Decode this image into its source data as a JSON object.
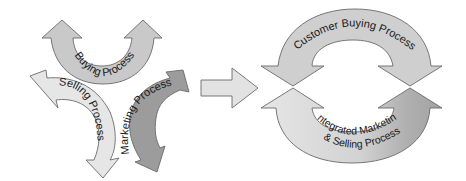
{
  "left_cycle": {
    "buying": {
      "label": "Buying Process",
      "fill": "#c9c9c9"
    },
    "selling": {
      "label": "Selling Process",
      "fill": "#e6e6e6"
    },
    "marketing": {
      "label": "Marketing Process",
      "fill": "#9c9c9c"
    }
  },
  "transition_arrow": {
    "fill": "#e2e2e2"
  },
  "right_cycle": {
    "top": {
      "label": "Customer Buying Process",
      "fill": "#cfcfcf"
    },
    "bottom": {
      "label_line1": "Integrated Marketing",
      "label_line2": "& Selling Process",
      "fill_light": "#e4e4e4",
      "fill_dark": "#a4a4a4"
    }
  }
}
